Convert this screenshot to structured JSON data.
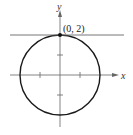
{
  "figure": {
    "type": "circle-with-tangent-line",
    "x_axis_label": "x",
    "y_axis_label": "y",
    "point_label": "(0,  2)",
    "point": [
      0,
      2
    ],
    "circle": {
      "center": [
        0,
        0
      ],
      "radius": 2
    },
    "tangent_line": {
      "y": 2
    },
    "ticks": {
      "x": [
        -1,
        1
      ],
      "y": [
        -1,
        1
      ]
    },
    "colors": {
      "curve": "#1a1a1a",
      "axis": "#555555",
      "line": "#555555"
    }
  }
}
